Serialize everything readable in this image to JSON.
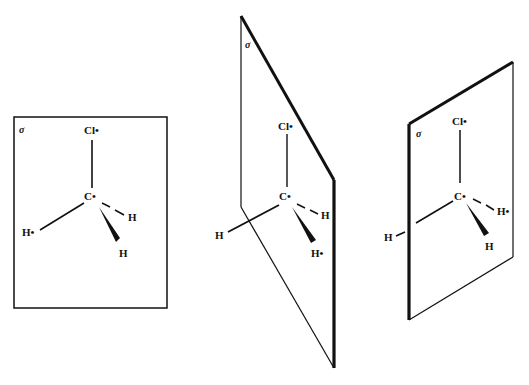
{
  "figure": {
    "panels": [
      {
        "id": "left",
        "plane_label": "σ",
        "atoms": {
          "top": "Cl•",
          "center": "C•",
          "left": "H•",
          "right_dashed": "H",
          "bottom_wedge": "H"
        }
      },
      {
        "id": "middle",
        "plane_label": "σ",
        "atoms": {
          "top": "Cl•",
          "center": "C•",
          "left": "H",
          "right_dashed": "H",
          "bottom_wedge": "H•"
        }
      },
      {
        "id": "right",
        "plane_label": "σ",
        "atoms": {
          "top": "Cl•",
          "center": "C•",
          "left": "H",
          "right_dashed": "H•",
          "bottom_wedge": "H"
        }
      }
    ],
    "colors": {
      "ink": "#111111",
      "background": "#ffffff"
    }
  }
}
